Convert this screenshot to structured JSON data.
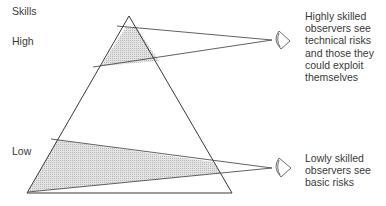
{
  "diagram": {
    "axis_label": "Skills",
    "levels": {
      "high": "High",
      "low": "Low"
    },
    "observers": [
      {
        "level": "high",
        "description": "Highly skilled\nobservers see\ntechnical risks\nand those they\ncould exploit\nthemselves"
      },
      {
        "level": "low",
        "description": "Lowly skilled\nobservers see\nbasic risks"
      }
    ],
    "colors": {
      "line": "#3a3a3a",
      "shade": "#d9d9d9"
    }
  }
}
